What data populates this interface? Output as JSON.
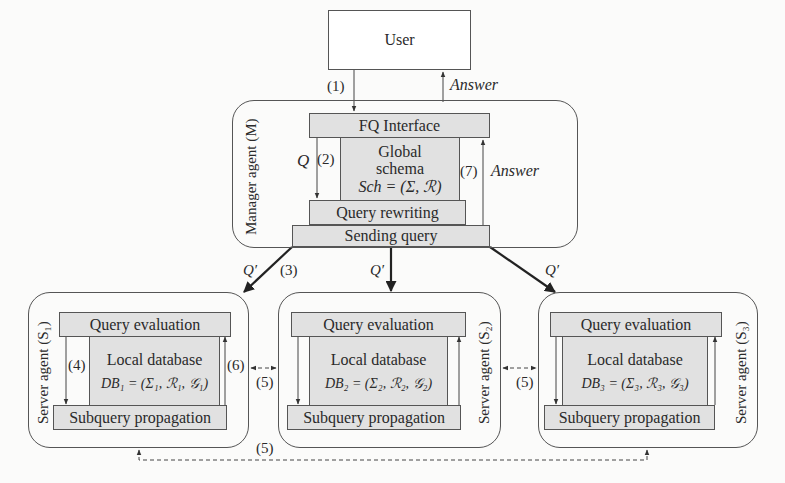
{
  "user": {
    "label": "User"
  },
  "edges_top": {
    "step1": "(1)",
    "answer": "Answer"
  },
  "manager": {
    "title": "Manager agent (M)",
    "fq_interface": "FQ Interface",
    "global_schema": {
      "line1": "Global",
      "line2": "schema",
      "formula": "Sch = (Σ, ℛ)"
    },
    "query_rewriting": "Query rewriting",
    "sending_query": "Sending query",
    "q_label": "Q",
    "step2": "(2)",
    "step7": "(7)",
    "answer": "Answer"
  },
  "dispatch": {
    "q_prime": "Q′",
    "step3": "(3)"
  },
  "servers": [
    {
      "title": "Server agent (S₁)",
      "query_evaluation": "Query evaluation",
      "local_db": "Local database",
      "formula": "DB₁ = (Σ₁, ℛ₁, 𝒢₁)",
      "subquery": "Subquery propagation",
      "step_down": "(4)",
      "step_up": "(6)"
    },
    {
      "title": "Server agent (S₂)",
      "query_evaluation": "Query evaluation",
      "local_db": "Local database",
      "formula": "DB₂ = (Σ₂, ℛ₂, 𝒢₂)",
      "subquery": "Subquery propagation"
    },
    {
      "title": "Server agent (S₃)",
      "query_evaluation": "Query evaluation",
      "local_db": "Local database",
      "formula": "DB₃ = (Σ₃, ℛ₃, 𝒢₃)",
      "subquery": "Subquery propagation"
    }
  ],
  "peer_links": {
    "s1_s2": "(5)",
    "s2_s3": "(5)",
    "s1_s3": "(5)"
  }
}
